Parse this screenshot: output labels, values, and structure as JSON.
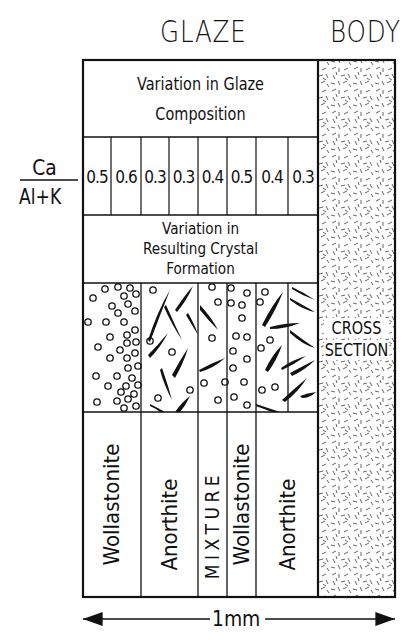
{
  "headers": {
    "glaze": "GLAZE",
    "body": "BODY"
  },
  "glaze_section": {
    "composition_label_line1": "Variation in Glaze",
    "composition_label_line2": "Composition",
    "ratio_label": {
      "numerator": "Ca",
      "denominator": "Al+K"
    },
    "ratio_values": [
      "0.5",
      "0.6",
      "0.3",
      "0.3",
      "0.4",
      "0.5",
      "0.4",
      "0.3"
    ],
    "crystal_label_line1": "Variation in",
    "crystal_label_line2": "Resulting Crystal",
    "crystal_label_line3": "Formation",
    "crystal_types": [
      {
        "label": "Wollastonite",
        "pattern": "circles"
      },
      {
        "label": "Anorthite",
        "pattern": "needles"
      },
      {
        "label": "MIXTURE",
        "pattern": "needles+circles"
      },
      {
        "label": "Wollastonite",
        "pattern": "circles"
      },
      {
        "label": "Anorthite",
        "pattern": "needles"
      }
    ]
  },
  "body_section": {
    "label_line1": "CROSS",
    "label_line2": "SECTION",
    "pattern": "random-dashes"
  },
  "scale_bar": {
    "label": "1mm"
  },
  "colors": {
    "ink": "#111111",
    "background": "#ffffff",
    "body_hatch": "#555555"
  }
}
